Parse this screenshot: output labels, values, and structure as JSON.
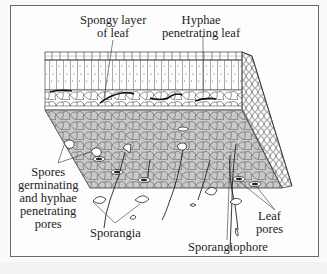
{
  "figure": {
    "colors": {
      "frame": "#6a6a6a",
      "leaf_underside_fill": "#c9c9c9",
      "line": "#2a2a2a",
      "background": "#fdfdfd"
    }
  },
  "labels": {
    "spongy_layer": {
      "line1": "Spongy layer",
      "line2": "of leaf"
    },
    "hyphae_leaf": {
      "line1": "Hyphae",
      "line2": "penetrating leaf"
    },
    "spores": {
      "line1": "Spores",
      "line2": "germinating",
      "line3": "and hyphae",
      "line4": "penetrating",
      "line5": "pores"
    },
    "leaf_pores": {
      "line1": "Leaf",
      "line2": "pores"
    },
    "sporangia": "Sporangia",
    "sporangiophore": "Sporangiophore"
  }
}
